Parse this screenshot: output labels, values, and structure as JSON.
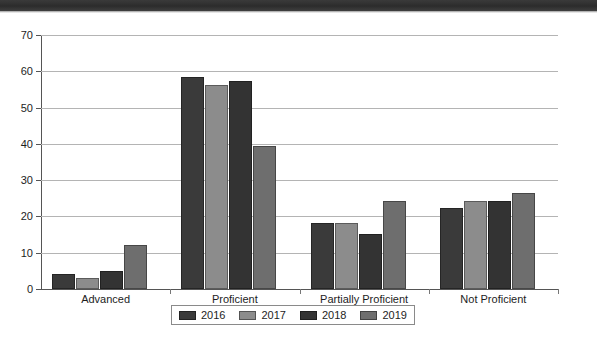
{
  "chart_data": {
    "type": "bar",
    "title": "",
    "subtitle": "",
    "xlabel": "",
    "ylabel": "",
    "ylim": [
      0,
      70
    ],
    "yticks": [
      0,
      10,
      20,
      30,
      40,
      50,
      60,
      70
    ],
    "ytick_labels": [
      "0",
      "10",
      "20",
      "30",
      "40",
      "50",
      "60",
      "70"
    ],
    "grid": true,
    "legend_position": "bottom",
    "categories": [
      "Advanced",
      "Proficient",
      "Partially Proficient",
      "Not Proficient"
    ],
    "series": [
      {
        "name": "2016",
        "color": "#3a3a3a",
        "values": [
          4.1,
          58.3,
          18.3,
          22.3
        ]
      },
      {
        "name": "2017",
        "color": "#8c8c8c",
        "values": [
          3.1,
          56.2,
          18.3,
          24.3
        ]
      },
      {
        "name": "2018",
        "color": "#333333",
        "values": [
          5.0,
          57.2,
          15.2,
          24.2
        ]
      },
      {
        "name": "2019",
        "color": "#6e6e6e",
        "values": [
          12.2,
          39.3,
          24.3,
          26.4
        ]
      }
    ]
  },
  "legend": {
    "items": [
      {
        "label": "2016"
      },
      {
        "label": "2017"
      },
      {
        "label": "2018"
      },
      {
        "label": "2019"
      }
    ]
  },
  "axes": {
    "y": {
      "ticks": [
        {
          "label": "70",
          "value": 70
        },
        {
          "label": "60",
          "value": 60
        },
        {
          "label": "50",
          "value": 50
        },
        {
          "label": "40",
          "value": 40
        },
        {
          "label": "30",
          "value": 30
        },
        {
          "label": "20",
          "value": 20
        },
        {
          "label": "10",
          "value": 10
        },
        {
          "label": "0",
          "value": 0
        }
      ]
    },
    "x": {
      "labels": [
        "Advanced",
        "Proficient",
        "Partially Proficient",
        "Not Proficient"
      ]
    }
  },
  "colors": {
    "series_2016": "#3a3a3a",
    "series_2017": "#8c8c8c",
    "series_2018": "#333333",
    "series_2019": "#6e6e6e",
    "gridline": "#b4b4b4",
    "axis": "#555555",
    "text": "#1d1d1d"
  }
}
